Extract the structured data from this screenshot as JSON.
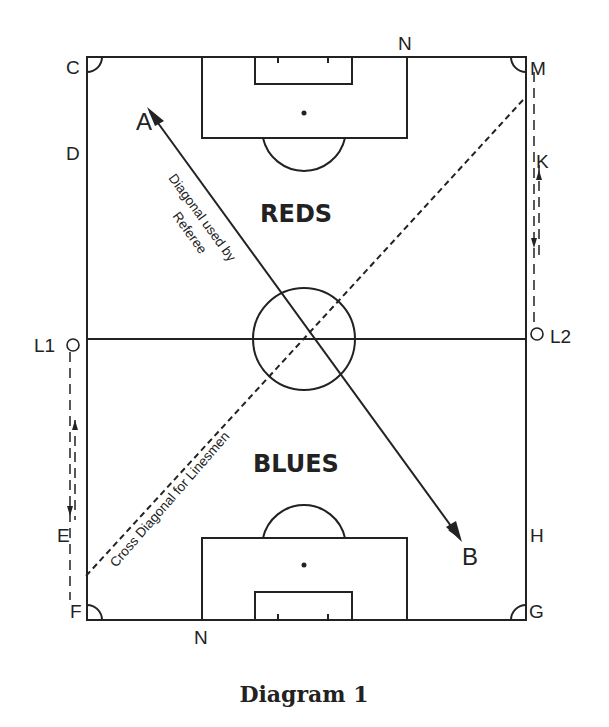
{
  "caption": "Diagram 1",
  "teams": {
    "top": "REDS",
    "bottom": "BLUES"
  },
  "points": {
    "A": "A",
    "B": "B",
    "C": "C",
    "D": "D",
    "E": "E",
    "F": "F",
    "G": "G",
    "H": "H",
    "K": "K",
    "M": "M",
    "N_top": "N",
    "N_bottom": "N",
    "L1": "L1",
    "L2": "L2"
  },
  "annotations": {
    "referee_line1": "Diagonal used by",
    "referee_line2": "Referee",
    "linesmen": "Cross Diagonal for Linesmen"
  },
  "colors": {
    "ink": "#222222",
    "paper": "#ffffff"
  }
}
